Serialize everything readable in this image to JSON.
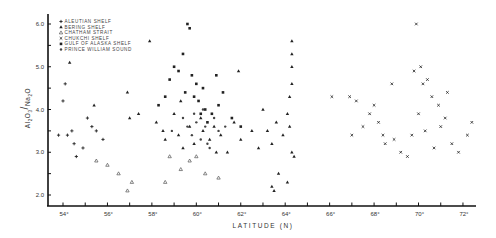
{
  "chart_data": {
    "type": "scatter",
    "title": "",
    "xlabel": "LATITUDE (N)",
    "ylabel": "Al2O3 / Na2O",
    "xlim": [
      53.5,
      72.6
    ],
    "ylim": [
      1.75,
      6.2
    ],
    "grid": false,
    "legend_position": "upper-left",
    "x_ticks": [
      54,
      56,
      58,
      60,
      62,
      64,
      66,
      68,
      70,
      72
    ],
    "x_tick_labels": [
      "54°",
      "56°",
      "58°",
      "60°",
      "62°",
      "64°",
      "66°",
      "68°",
      "70°",
      "72°"
    ],
    "y_ticks": [
      2.0,
      3.0,
      4.0,
      5.0,
      6.0
    ],
    "y_tick_labels": [
      "2.0",
      "3.0",
      "4.0",
      "5.0",
      "6.0"
    ],
    "series": [
      {
        "name": "ALEUTIAN SHELF",
        "marker": "+",
        "points": [
          [
            53.8,
            3.4
          ],
          [
            54.2,
            3.4
          ],
          [
            54.5,
            3.2
          ],
          [
            54.4,
            3.5
          ],
          [
            54.6,
            2.9
          ],
          [
            54.0,
            4.2
          ],
          [
            54.1,
            4.6
          ],
          [
            55.3,
            3.6
          ],
          [
            55.5,
            3.5
          ],
          [
            55.1,
            3.8
          ],
          [
            55.8,
            3.3
          ],
          [
            54.9,
            3.1
          ]
        ]
      },
      {
        "name": "BERING SHELF",
        "marker": "triangle",
        "points": [
          [
            54.3,
            5.1
          ],
          [
            55.4,
            4.1
          ],
          [
            56.9,
            4.4
          ],
          [
            57.9,
            5.6
          ],
          [
            57.0,
            3.8
          ],
          [
            57.4,
            3.9
          ],
          [
            58.2,
            3.7
          ],
          [
            58.5,
            3.5
          ],
          [
            58.6,
            3.3
          ],
          [
            59.0,
            3.9
          ],
          [
            59.2,
            3.4
          ],
          [
            59.3,
            4.2
          ],
          [
            59.4,
            3.1
          ],
          [
            59.7,
            3.6
          ],
          [
            59.9,
            3.2
          ],
          [
            60.2,
            3.8
          ],
          [
            60.3,
            3.5
          ],
          [
            60.6,
            3.3
          ],
          [
            60.8,
            3.6
          ],
          [
            61.1,
            3.4
          ],
          [
            61.4,
            3.0
          ],
          [
            61.7,
            3.7
          ],
          [
            62.0,
            3.3
          ],
          [
            62.5,
            3.5
          ],
          [
            62.8,
            3.1
          ],
          [
            63.0,
            4.0
          ],
          [
            63.2,
            3.5
          ],
          [
            63.4,
            3.2
          ],
          [
            63.6,
            3.7
          ],
          [
            63.9,
            3.4
          ],
          [
            64.1,
            3.9
          ],
          [
            64.2,
            4.3
          ],
          [
            64.3,
            4.6
          ],
          [
            64.3,
            5.0
          ],
          [
            64.3,
            5.3
          ],
          [
            64.3,
            5.6
          ],
          [
            64.2,
            3.6
          ],
          [
            64.3,
            3.0
          ],
          [
            64.4,
            2.9
          ],
          [
            63.7,
            2.5
          ],
          [
            63.4,
            2.2
          ],
          [
            64.1,
            2.3
          ],
          [
            63.5,
            2.1
          ],
          [
            60.9,
            3.0
          ],
          [
            61.9,
            4.9
          ]
        ]
      },
      {
        "name": "CHATHAM STRAIT",
        "marker": "open-triangle",
        "points": [
          [
            55.5,
            2.8
          ],
          [
            56.0,
            2.7
          ],
          [
            56.5,
            2.5
          ],
          [
            57.1,
            2.3
          ],
          [
            56.9,
            2.1
          ],
          [
            58.6,
            2.3
          ],
          [
            59.3,
            2.6
          ],
          [
            60.4,
            2.5
          ],
          [
            61.0,
            2.4
          ],
          [
            60.0,
            2.9
          ],
          [
            59.7,
            2.8
          ],
          [
            58.8,
            2.9
          ]
        ]
      },
      {
        "name": "CHUKCHI SHELF",
        "marker": "x",
        "points": [
          [
            66.1,
            4.3
          ],
          [
            66.9,
            4.3
          ],
          [
            67.2,
            4.2
          ],
          [
            67.5,
            3.6
          ],
          [
            67.8,
            3.9
          ],
          [
            68.0,
            4.1
          ],
          [
            68.2,
            3.7
          ],
          [
            68.4,
            3.4
          ],
          [
            68.5,
            3.2
          ],
          [
            68.9,
            3.3
          ],
          [
            69.2,
            3.0
          ],
          [
            69.5,
            2.9
          ],
          [
            69.7,
            3.4
          ],
          [
            69.8,
            4.9
          ],
          [
            70.1,
            5.0
          ],
          [
            70.2,
            4.6
          ],
          [
            70.4,
            4.7
          ],
          [
            70.6,
            4.3
          ],
          [
            70.9,
            4.1
          ],
          [
            71.0,
            3.6
          ],
          [
            71.2,
            3.8
          ],
          [
            71.5,
            3.2
          ],
          [
            71.8,
            3.0
          ],
          [
            72.2,
            3.4
          ],
          [
            72.4,
            3.7
          ],
          [
            70.0,
            3.9
          ],
          [
            70.3,
            3.5
          ],
          [
            70.7,
            3.1
          ],
          [
            71.3,
            4.4
          ],
          [
            69.9,
            6.0
          ],
          [
            68.8,
            4.6
          ],
          [
            67.0,
            3.4
          ]
        ]
      },
      {
        "name": "GULF OF ALASKA SHELF",
        "marker": "filled-square",
        "points": [
          [
            58.3,
            4.1
          ],
          [
            58.6,
            4.3
          ],
          [
            58.8,
            4.7
          ],
          [
            59.0,
            5.0
          ],
          [
            59.2,
            4.9
          ],
          [
            59.4,
            5.3
          ],
          [
            59.6,
            6.0
          ],
          [
            59.7,
            5.9
          ],
          [
            59.8,
            4.8
          ],
          [
            60.0,
            4.6
          ],
          [
            60.1,
            4.2
          ],
          [
            60.2,
            3.9
          ],
          [
            60.4,
            4.0
          ],
          [
            60.5,
            3.7
          ],
          [
            60.7,
            3.9
          ],
          [
            61.0,
            4.1
          ],
          [
            61.2,
            4.4
          ],
          [
            61.6,
            3.8
          ],
          [
            62.0,
            3.6
          ],
          [
            59.5,
            4.4
          ],
          [
            59.9,
            4.3
          ],
          [
            60.3,
            4.5
          ],
          [
            60.9,
            4.8
          ]
        ]
      },
      {
        "name": "PRINCE WILLIAM SOUND",
        "marker": "circle",
        "points": [
          [
            59.6,
            3.6
          ],
          [
            59.8,
            3.4
          ],
          [
            60.0,
            3.7
          ],
          [
            60.2,
            3.3
          ],
          [
            60.4,
            3.6
          ],
          [
            60.6,
            3.1
          ],
          [
            60.8,
            3.8
          ],
          [
            61.0,
            3.5
          ],
          [
            59.9,
            3.9
          ],
          [
            60.3,
            4.0
          ],
          [
            60.5,
            3.2
          ],
          [
            61.3,
            3.6
          ],
          [
            58.9,
            3.5
          ],
          [
            59.4,
            3.8
          ]
        ]
      }
    ]
  },
  "axes": {
    "x_title": "LATITUDE (N)",
    "y_title_main": "Al",
    "y_title_sub1": "2",
    "y_title_mid": "O",
    "y_title_sub2": "3",
    "y_title_slash": "/",
    "y_title_na": "Na",
    "y_title_sub3": "2",
    "y_title_o": "O"
  },
  "legend": {
    "items": [
      {
        "label": "ALEUTIAN SHELF",
        "marker": "+"
      },
      {
        "label": "BERING SHELF",
        "marker": "▲"
      },
      {
        "label": "CHATHAM STRAIT",
        "marker": "△"
      },
      {
        "label": "CHUKCHI SHELF",
        "marker": "×"
      },
      {
        "label": "GULF OF ALASKA SHELF",
        "marker": "■"
      },
      {
        "label": "PRINCE WILLIAM SOUND",
        "marker": "●"
      }
    ]
  },
  "colors": {
    "ink": "#222222",
    "background": "#ffffff"
  }
}
